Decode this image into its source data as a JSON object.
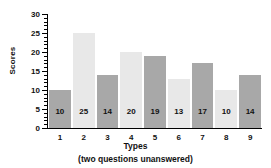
{
  "chart_data": {
    "type": "bar",
    "title": "",
    "categories": [
      "1",
      "2",
      "3",
      "4",
      "5",
      "6",
      "7",
      "8",
      "9"
    ],
    "values": [
      10,
      25,
      14,
      20,
      19,
      13,
      17,
      10,
      14
    ],
    "xlabel": "Types",
    "xsublabel": "(two questions unanswered)",
    "ylabel": "Scores",
    "ylim": [
      0,
      30
    ],
    "ytick_labels": [
      "0",
      "5",
      "10",
      "15",
      "20",
      "25",
      "30"
    ],
    "ytick_values": [
      0,
      5,
      10,
      15,
      20,
      25,
      30
    ],
    "ytick_minor_step": 1,
    "grid": false,
    "legend": false,
    "bar_colors": [
      "#a8a8a8",
      "#e8e8e8",
      "#a8a8a8",
      "#e8e8e8",
      "#a8a8a8",
      "#e8e8e8",
      "#a8a8a8",
      "#e8e8e8",
      "#a8a8a8"
    ],
    "value_label_color": "#111111",
    "axis_color": "#000000"
  }
}
